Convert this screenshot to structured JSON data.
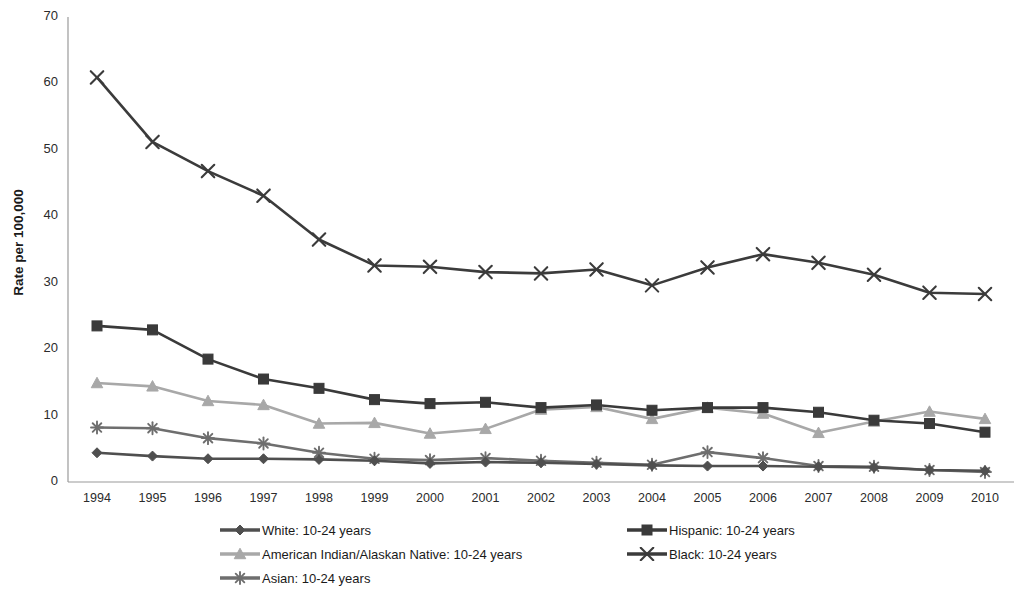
{
  "chart_data": {
    "type": "line",
    "title": "",
    "xlabel": "",
    "ylabel": "Rate per 100,000",
    "categories": [
      "1994",
      "1995",
      "1996",
      "1997",
      "1998",
      "1999",
      "2000",
      "2001",
      "2002",
      "2003",
      "2004",
      "2005",
      "2006",
      "2007",
      "2008",
      "2009",
      "2010"
    ],
    "xlim": [
      1994,
      2010
    ],
    "ylim": [
      0,
      70
    ],
    "yticks": [
      "0",
      "10",
      "20",
      "30",
      "40",
      "50",
      "60",
      "70"
    ],
    "grid": false,
    "legend_position": "bottom",
    "series": [
      {
        "name": "White: 10-24 years",
        "legend_label": "White: 10-24 years",
        "marker": "diamond",
        "color": "#4f4f4f",
        "values": [
          4.4,
          3.9,
          3.5,
          3.5,
          3.4,
          3.2,
          2.8,
          3.0,
          2.9,
          2.7,
          2.5,
          2.4,
          2.4,
          2.3,
          2.2,
          1.8,
          1.7
        ]
      },
      {
        "name": "Hispanic: 10-24 years",
        "legend_label": "Hispanic: 10-24 years",
        "marker": "square",
        "color": "#3a3a3a",
        "values": [
          23.5,
          22.9,
          18.5,
          15.5,
          14.1,
          12.4,
          11.8,
          12.0,
          11.2,
          11.6,
          10.8,
          11.2,
          11.2,
          10.5,
          9.3,
          8.8,
          7.5
        ]
      },
      {
        "name": "American Indian/Alaskan Native: 10-24 years",
        "legend_label": "American Indian/Alaskan Native: 10-24 years",
        "marker": "triangle",
        "color": "#a8a8a8",
        "values": [
          14.9,
          14.4,
          12.2,
          11.6,
          8.8,
          8.9,
          7.3,
          8.0,
          10.9,
          11.3,
          9.5,
          11.2,
          10.3,
          7.4,
          9.1,
          10.6,
          9.5
        ]
      },
      {
        "name": "Black: 10-24 years",
        "legend_label": "Black: 10-24 years",
        "marker": "x",
        "color": "#3b3b3b",
        "values": [
          60.9,
          51.2,
          46.8,
          43.1,
          36.5,
          32.6,
          32.4,
          31.6,
          31.4,
          32.0,
          29.6,
          32.3,
          34.3,
          33.0,
          31.2,
          28.5,
          28.3
        ]
      },
      {
        "name": "Asian: 10-24 years",
        "legend_label": "Asian: 10-24 years",
        "marker": "star",
        "color": "#6e6e6e",
        "values": [
          8.2,
          8.1,
          6.6,
          5.8,
          4.4,
          3.5,
          3.3,
          3.6,
          3.2,
          2.9,
          2.6,
          4.5,
          3.6,
          2.4,
          2.3,
          1.8,
          1.5
        ]
      }
    ]
  },
  "legend": {
    "left_column": [
      "White: 10-24 years",
      "American Indian/Alaskan Native: 10-24 years",
      "Asian: 10-24 years"
    ],
    "right_column": [
      "Hispanic: 10-24 years",
      "Black: 10-24 years"
    ]
  },
  "axes": {
    "y_title": "Rate per 100,000",
    "y_ticks": [
      "70",
      "60",
      "50",
      "40",
      "30",
      "20",
      "10",
      "0"
    ],
    "x_ticks": [
      "1994",
      "1995",
      "1996",
      "1997",
      "1998",
      "1999",
      "2000",
      "2001",
      "2002",
      "2003",
      "2004",
      "2005",
      "2006",
      "2007",
      "2008",
      "2009",
      "2010"
    ]
  },
  "colors": {
    "axis": "#9a9a9a",
    "white_series": "#4f4f4f",
    "hispanic_series": "#3a3a3a",
    "american_indian_series": "#a8a8a8",
    "black_series": "#3b3b3b",
    "asian_series": "#6e6e6e"
  }
}
